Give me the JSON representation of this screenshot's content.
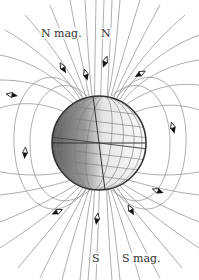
{
  "labels": {
    "n_mag": "N mag.",
    "n_geo": "N",
    "s_geo": "S",
    "s_mag": "S mag."
  },
  "colors": {
    "field_line": "#8a8a8a",
    "globe_outline": "#333333",
    "globe_dark": "#6e6e6e",
    "globe_light": "#f4f4f4",
    "grid_line": "#777777",
    "needle_dark": "#111111",
    "needle_light": "#ffffff",
    "text": "#333333"
  },
  "globe": {
    "cx": 99,
    "cy": 143,
    "r": 47,
    "axis_tilt_deg": 7
  },
  "compass_needles": [
    {
      "x": 12,
      "y": 95,
      "angle": 10
    },
    {
      "x": 25,
      "y": 153,
      "angle": 95
    },
    {
      "x": 63,
      "y": 68,
      "angle": 60
    },
    {
      "x": 86,
      "y": 75,
      "angle": 75
    },
    {
      "x": 105,
      "y": 62,
      "angle": 110
    },
    {
      "x": 140,
      "y": 74,
      "angle": 150
    },
    {
      "x": 173,
      "y": 128,
      "angle": 75
    },
    {
      "x": 158,
      "y": 191,
      "angle": 20
    },
    {
      "x": 131,
      "y": 210,
      "angle": 60
    },
    {
      "x": 97,
      "y": 219,
      "angle": 100
    },
    {
      "x": 57,
      "y": 212,
      "angle": 155
    }
  ]
}
